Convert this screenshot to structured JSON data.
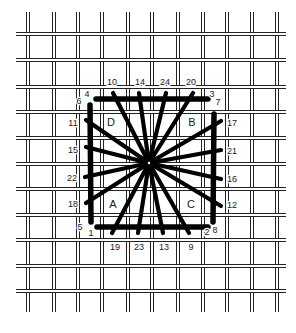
{
  "diagram": {
    "title": "",
    "grid": {
      "columns_x": [
        28,
        54,
        78,
        102,
        128,
        152,
        178,
        203,
        227,
        252,
        277
      ],
      "rows_y": [
        34,
        60,
        87,
        112,
        138,
        164,
        189,
        215,
        240,
        266,
        291
      ],
      "x_extent": [
        16,
        286
      ],
      "y_extent": [
        12,
        312
      ],
      "line_gap": 3,
      "line_color": "#222222"
    },
    "center": {
      "x": 149,
      "y": 163
    },
    "stitch_color": "#000000",
    "frame": {
      "top": {
        "label_start": "4",
        "label_end": "3"
      },
      "bottom": {
        "label_start": "1",
        "label_end": "2"
      },
      "left": {
        "label_start": "6",
        "label_end": "5"
      },
      "right": {
        "label_start": "7",
        "label_end": "8"
      }
    },
    "corner_labels": [
      {
        "id": "4",
        "text": "4",
        "x": 87,
        "y": 97
      },
      {
        "id": "6",
        "text": "6",
        "x": 79,
        "y": 104
      },
      {
        "id": "3",
        "text": "3",
        "x": 212,
        "y": 97
      },
      {
        "id": "7",
        "text": "7",
        "x": 218,
        "y": 105
      },
      {
        "id": "5",
        "text": "5",
        "x": 80,
        "y": 230
      },
      {
        "id": "1",
        "text": "1",
        "x": 91,
        "y": 236
      },
      {
        "id": "2",
        "text": "2",
        "x": 207,
        "y": 235
      },
      {
        "id": "8",
        "text": "8",
        "x": 215,
        "y": 233
      }
    ],
    "spoke_labels": {
      "top": [
        {
          "text": "10",
          "x": 112,
          "y": 85
        },
        {
          "text": "14",
          "x": 140,
          "y": 85
        },
        {
          "text": "24",
          "x": 165,
          "y": 85
        },
        {
          "text": "20",
          "x": 191,
          "y": 85
        }
      ],
      "bottom": [
        {
          "text": "19",
          "x": 115,
          "y": 250
        },
        {
          "text": "23",
          "x": 139,
          "y": 250
        },
        {
          "text": "13",
          "x": 164,
          "y": 250
        },
        {
          "text": "9",
          "x": 191,
          "y": 250
        }
      ],
      "left": [
        {
          "text": "11",
          "x": 73,
          "y": 126
        },
        {
          "text": "15",
          "x": 73,
          "y": 153
        },
        {
          "text": "22",
          "x": 72,
          "y": 181
        },
        {
          "text": "18",
          "x": 73,
          "y": 207
        }
      ],
      "right": [
        {
          "text": "17",
          "x": 232,
          "y": 126
        },
        {
          "text": "21",
          "x": 232,
          "y": 154
        },
        {
          "text": "16",
          "x": 232,
          "y": 182
        },
        {
          "text": "12",
          "x": 232,
          "y": 208
        }
      ]
    },
    "quadrant_letters": [
      {
        "text": "D",
        "x": 111,
        "y": 126
      },
      {
        "text": "B",
        "x": 192,
        "y": 126
      },
      {
        "text": "A",
        "x": 113,
        "y": 208
      },
      {
        "text": "C",
        "x": 191,
        "y": 208
      }
    ],
    "spokes": [
      {
        "to": "10",
        "x": 113,
        "y": 93
      },
      {
        "to": "14",
        "x": 139,
        "y": 93
      },
      {
        "to": "24",
        "x": 166,
        "y": 93
      },
      {
        "to": "20",
        "x": 193,
        "y": 93
      },
      {
        "to": "19",
        "x": 112,
        "y": 233
      },
      {
        "to": "23",
        "x": 138,
        "y": 233
      },
      {
        "to": "13",
        "x": 163,
        "y": 233
      },
      {
        "to": "9",
        "x": 189,
        "y": 233
      },
      {
        "to": "11",
        "x": 86,
        "y": 120
      },
      {
        "to": "15",
        "x": 86,
        "y": 147
      },
      {
        "to": "22",
        "x": 85,
        "y": 177
      },
      {
        "to": "18",
        "x": 86,
        "y": 203
      },
      {
        "to": "17",
        "x": 221,
        "y": 121
      },
      {
        "to": "21",
        "x": 221,
        "y": 150
      },
      {
        "to": "16",
        "x": 221,
        "y": 179
      },
      {
        "to": "12",
        "x": 221,
        "y": 206
      }
    ],
    "frame_bars": [
      {
        "side": "top",
        "x1": 96,
        "y1": 99,
        "x2": 208,
        "y2": 99
      },
      {
        "side": "bottom",
        "x1": 97,
        "y1": 227,
        "x2": 208,
        "y2": 227
      },
      {
        "side": "left",
        "x1": 90,
        "y1": 105,
        "x2": 91,
        "y2": 222
      },
      {
        "side": "right",
        "x1": 214,
        "y1": 114,
        "x2": 213,
        "y2": 222
      }
    ]
  }
}
